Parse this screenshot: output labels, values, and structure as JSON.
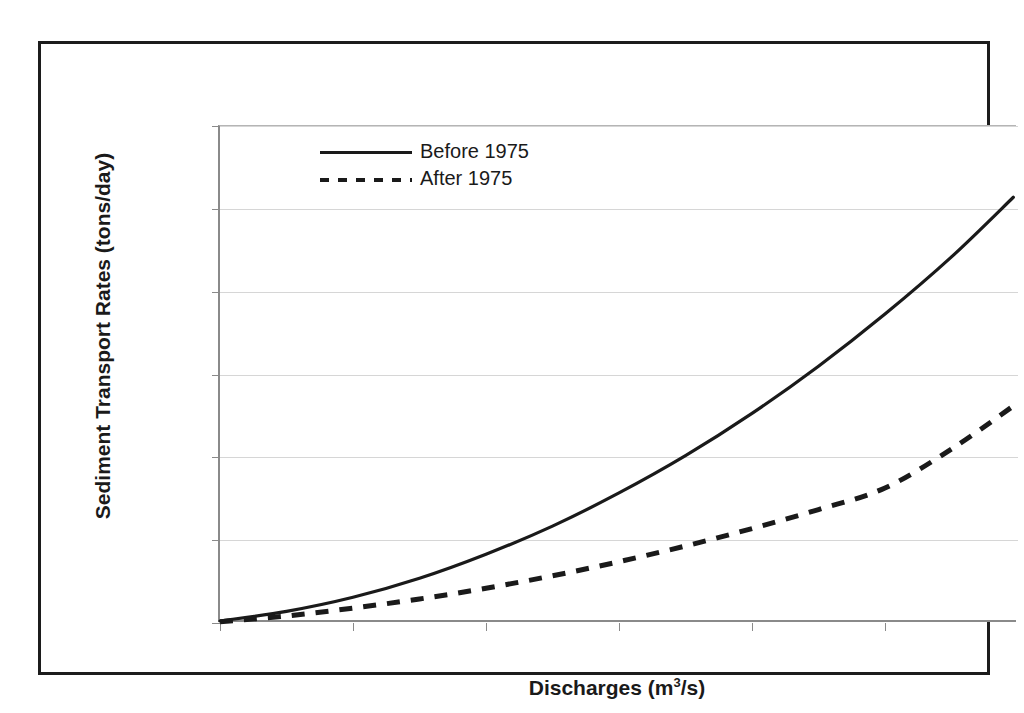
{
  "chart_data": {
    "type": "line",
    "title": "",
    "subtitle": "",
    "xlabel": "Discharges (m3/s)",
    "xlabel_base": "Discharges (m",
    "xlabel_sup": "3",
    "xlabel_tail": "/s)",
    "ylabel": "Sediment Transport Rates (tons/day)",
    "xlim": [
      50,
      1250
    ],
    "ylim": [
      0,
      300000
    ],
    "grid": true,
    "grid_axis": "y",
    "legend_position": "top-center",
    "xticks": [
      50,
      250,
      450,
      650,
      850,
      1050
    ],
    "xtick_labels": [
      "50",
      "250",
      "450",
      "650",
      "850",
      "1050"
    ],
    "yticks": [
      0,
      50000,
      100000,
      150000,
      200000,
      250000,
      300000
    ],
    "ytick_labels": [
      "0",
      "50000",
      "100000",
      "150000",
      "200000",
      "250000",
      "300000"
    ],
    "x": [
      50,
      150,
      250,
      350,
      450,
      550,
      650,
      750,
      850,
      950,
      1050,
      1150,
      1243
    ],
    "series": [
      {
        "name": "Before 1975",
        "style": "solid",
        "color": "#1a1a1a",
        "values": [
          1200,
          7000,
          15500,
          27000,
          41500,
          58500,
          78500,
          101000,
          126500,
          155000,
          186500,
          221000,
          257000
        ]
      },
      {
        "name": "After 1975",
        "style": "dashed",
        "color": "#1a1a1a",
        "values": [
          800,
          4200,
          9000,
          14500,
          21000,
          28500,
          37000,
          46500,
          57000,
          68500,
          81500,
          105000,
          131000
        ]
      }
    ]
  },
  "legend": {
    "items": [
      {
        "label": "Before 1975",
        "style": "solid"
      },
      {
        "label": "After 1975",
        "style": "dashed"
      }
    ]
  },
  "colors": {
    "series_line": "#1a1a1a",
    "gridline": "#d6d6d6",
    "axis": "#8a8a8a",
    "frame": "#1c1c1c",
    "background": "#ffffff"
  }
}
